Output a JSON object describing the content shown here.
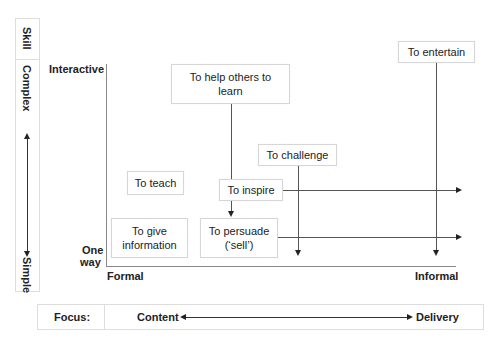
{
  "skill_axis": {
    "header": "Skill",
    "top_label": "Complex",
    "bottom_label": "Simple"
  },
  "y_axis": {
    "top_label": "Interactive",
    "bottom_label_line1": "One",
    "bottom_label_line2": "way"
  },
  "x_axis": {
    "left_label": "Formal",
    "right_label": "Informal"
  },
  "boxes": {
    "help_others": {
      "line1": "To help others to",
      "line2": "learn"
    },
    "entertain": {
      "line1": "To entertain"
    },
    "challenge": {
      "line1": "To challenge"
    },
    "teach": {
      "line1": "To teach"
    },
    "inspire": {
      "line1": "To inspire"
    },
    "give_info": {
      "line1": "To give",
      "line2": "information"
    },
    "persuade": {
      "line1": "To persuade",
      "line2": "(‘sell’)"
    }
  },
  "focus_bar": {
    "label": "Focus:",
    "left": "Content",
    "right": "Delivery"
  },
  "colors": {
    "line": "#555555",
    "border": "#d6d6d6",
    "text": "#222222"
  }
}
